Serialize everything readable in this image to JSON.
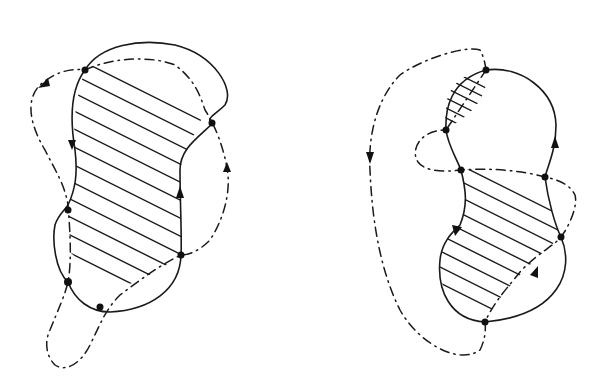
{
  "figure": {
    "colors": {
      "ink": "#1a1a1a",
      "background": "#ffffff"
    },
    "panels": [
      {
        "id": "left",
        "solid_curve": "peanut-shaped closed curve",
        "dashdot_curve": "closed curve with lower tail loop",
        "intersection_points": 6,
        "hatched_regions": 1,
        "arrows": 4
      },
      {
        "id": "right",
        "solid_curve": "figure-eight-like closed curve (two lobes)",
        "dashdot_curve": "outer loop with inner crossing",
        "intersection_points": 6,
        "hatched_regions": 2,
        "arrows": 4
      }
    ]
  }
}
